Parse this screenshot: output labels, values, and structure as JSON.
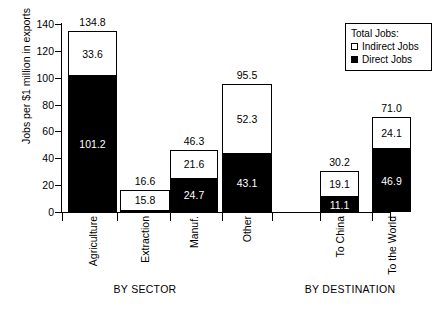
{
  "chart_data": {
    "type": "bar",
    "stacked": true,
    "title": "",
    "xlabel": "",
    "ylabel": "Jobs per $1 million in exports",
    "ylim": [
      0,
      140
    ],
    "yticks": [
      0,
      20,
      40,
      60,
      80,
      100,
      120,
      140
    ],
    "grid": false,
    "legend_position": "top-right",
    "legend_title": "Total Jobs:",
    "series": [
      {
        "name": "Direct Jobs",
        "color": "#000000",
        "values": [
          101.2,
          0.8,
          24.7,
          43.1,
          11.1,
          46.9
        ]
      },
      {
        "name": "Indirect Jobs",
        "color": "#ffffff",
        "values": [
          33.6,
          15.8,
          21.6,
          52.3,
          19.1,
          24.1
        ]
      }
    ],
    "categories": [
      "Agriculture",
      "Extraction",
      "Manuf.",
      "Other",
      "To China",
      "To the World"
    ],
    "totals": [
      134.8,
      16.6,
      46.3,
      95.5,
      30.2,
      71.0
    ],
    "groups": [
      {
        "label": "BY SECTOR",
        "categories": [
          "Agriculture",
          "Extraction",
          "Manuf.",
          "Other"
        ]
      },
      {
        "label": "BY DESTINATION",
        "categories": [
          "To China",
          "To the World"
        ]
      }
    ]
  },
  "axis": {
    "y_label": "Jobs per $1 million in exports",
    "y_ticks": [
      "140",
      "120",
      "100",
      "80",
      "60",
      "40",
      "20",
      "0"
    ]
  },
  "legend": {
    "title": "Total Jobs:",
    "items": [
      {
        "label": "Indirect Jobs",
        "swatch": "open-square"
      },
      {
        "label": "Direct Jobs",
        "swatch": "filled-square"
      }
    ]
  },
  "bars": [
    {
      "category": "Agriculture",
      "total": "134.8",
      "direct": "101.2",
      "indirect": "33.6",
      "direct_value": 101.2,
      "indirect_value": 33.6,
      "total_value": 134.8,
      "show_direct_label": true,
      "show_indirect_label": true
    },
    {
      "category": "Extraction",
      "total": "16.6",
      "direct": "",
      "indirect": "15.8",
      "direct_value": 0.8,
      "indirect_value": 15.8,
      "total_value": 16.6,
      "show_direct_label": false,
      "show_indirect_label": true
    },
    {
      "category": "Manuf.",
      "total": "46.3",
      "direct": "24.7",
      "indirect": "21.6",
      "direct_value": 24.7,
      "indirect_value": 21.6,
      "total_value": 46.3,
      "show_direct_label": true,
      "show_indirect_label": true
    },
    {
      "category": "Other",
      "total": "95.5",
      "direct": "43.1",
      "indirect": "52.3",
      "direct_value": 43.1,
      "indirect_value": 52.3,
      "total_value": 95.5,
      "show_direct_label": true,
      "show_indirect_label": true
    },
    {
      "category": "To China",
      "total": "30.2",
      "direct": "11.1",
      "indirect": "19.1",
      "direct_value": 11.1,
      "indirect_value": 19.1,
      "total_value": 30.2,
      "show_direct_label": true,
      "show_indirect_label": true
    },
    {
      "category": "To the World",
      "total": "71.0",
      "direct": "46.9",
      "indirect": "24.1",
      "direct_value": 46.9,
      "indirect_value": 24.1,
      "total_value": 71.0,
      "show_direct_label": true,
      "show_indirect_label": true
    }
  ],
  "groups": [
    {
      "label": "BY SECTOR"
    },
    {
      "label": "BY DESTINATION"
    }
  ]
}
